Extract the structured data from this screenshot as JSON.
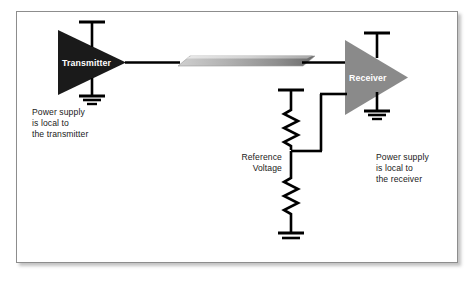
{
  "diagram": {
    "type": "circuit-schematic",
    "frame": {
      "border_color": "#8d8d8d",
      "background": "#ffffff"
    },
    "blocks": [
      {
        "id": "transmitter",
        "label": "Transmitter",
        "shape": "triangle-right",
        "fill": "#1a1a1a",
        "text_color": "#ffffff"
      },
      {
        "id": "receiver",
        "label": "Receiver",
        "shape": "triangle-right",
        "fill": "#8a8a8a",
        "text_color": "#ffffff"
      }
    ],
    "cable": {
      "name": "transmission-line",
      "style": "shaded-parallelogram",
      "fill_light": "#d6d6d6",
      "fill_dark": "#6f6f6f"
    },
    "captions": {
      "transmitter_supply": "Power supply\nis local to\nthe transmitter",
      "receiver_supply": "Power supply\nis local to\nthe receiver"
    },
    "labels": {
      "reference_voltage": "Reference\nVoltage"
    },
    "components": {
      "resistor_top": "resistor-upper",
      "resistor_bottom": "resistor-lower",
      "ground_transmitter": "ground-symbol",
      "ground_receiver": "ground-symbol",
      "ground_divider": "ground-symbol",
      "rail_transmitter_top": "power-rail",
      "rail_transmitter_bottom": "power-rail",
      "rail_receiver_top": "power-rail",
      "rail_divider_top": "power-rail"
    },
    "colors": {
      "wire": "#000000",
      "transmitter_fill": "#1a1a1a",
      "receiver_fill": "#8a8a8a",
      "text": "#1a1a1a"
    }
  }
}
